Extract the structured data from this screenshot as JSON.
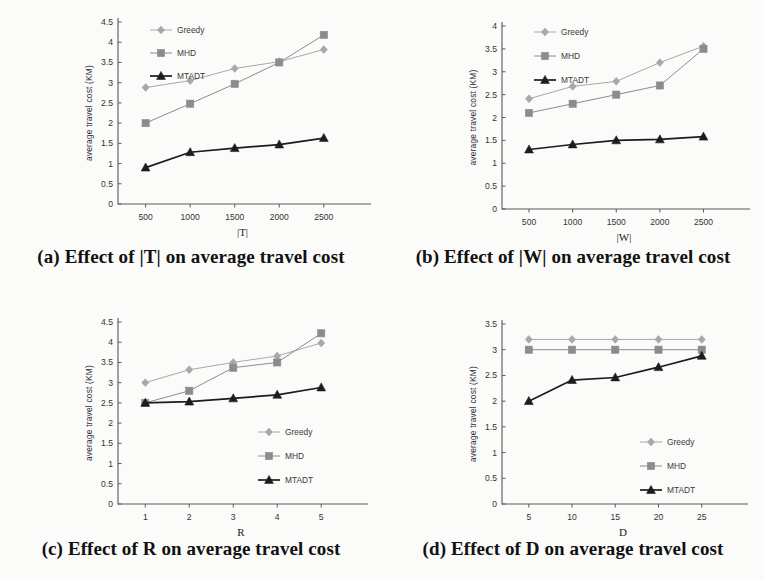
{
  "figure": {
    "series_names": [
      "Greedy",
      "MHD",
      "MTADT"
    ],
    "colors": {
      "greedy": "#a8a8a8",
      "mhd": "#8c8c8c",
      "mtadt": "#1c1c1c",
      "axis": "#5a5a5a",
      "text": "#1a1a1a"
    },
    "y_axis_label": "average travel cost (KM)"
  },
  "panels": [
    {
      "id": "a",
      "caption": "(a) Effect of |T| on average travel cost",
      "chart_data": {
        "type": "line",
        "title": "",
        "xlabel": "|T|",
        "ylabel": "average travel cost (KM)",
        "x": [
          500,
          1000,
          1500,
          2000,
          2500
        ],
        "xticklabels": [
          "500",
          "1000",
          "1500",
          "2000",
          "2500"
        ],
        "ylim": [
          0,
          4.5
        ],
        "yticks": [
          0,
          0.5,
          1,
          1.5,
          2,
          2.5,
          3,
          3.5,
          4,
          4.5
        ],
        "yticklabels": [
          "0",
          "0.5",
          "1",
          "1.5",
          "2",
          "2.5",
          "3",
          "3.5",
          "4",
          "4.5"
        ],
        "grid": false,
        "legend_position": "top-left-inside",
        "series": [
          {
            "name": "Greedy",
            "marker": "diamond",
            "values": [
              2.88,
              3.05,
              3.35,
              3.52,
              3.82
            ]
          },
          {
            "name": "MHD",
            "marker": "square",
            "values": [
              2.0,
              2.48,
              2.97,
              3.5,
              4.18
            ]
          },
          {
            "name": "MTADT",
            "marker": "triangle",
            "values": [
              0.9,
              1.28,
              1.38,
              1.47,
              1.63
            ]
          }
        ]
      }
    },
    {
      "id": "b",
      "caption": "(b) Effect of |W| on average travel cost",
      "chart_data": {
        "type": "line",
        "title": "",
        "xlabel": "|W|",
        "ylabel": "average travel cost (KM)",
        "x": [
          500,
          1000,
          1500,
          2000,
          2500
        ],
        "xticklabels": [
          "500",
          "1000",
          "1500",
          "2000",
          "2500"
        ],
        "ylim": [
          0,
          4
        ],
        "yticks": [
          0,
          0.5,
          1,
          1.5,
          2,
          2.5,
          3,
          3.5,
          4
        ],
        "yticklabels": [
          "0",
          "0.5",
          "1",
          "1.5",
          "2",
          "2.5",
          "3",
          "3.5",
          "4"
        ],
        "grid": false,
        "legend_position": "top-left-inside",
        "series": [
          {
            "name": "Greedy",
            "marker": "diamond",
            "values": [
              2.41,
              2.68,
              2.79,
              3.2,
              3.56
            ]
          },
          {
            "name": "MHD",
            "marker": "square",
            "values": [
              2.1,
              2.3,
              2.5,
              2.7,
              3.5
            ]
          },
          {
            "name": "MTADT",
            "marker": "triangle",
            "values": [
              1.3,
              1.41,
              1.5,
              1.52,
              1.58
            ]
          }
        ]
      }
    },
    {
      "id": "c",
      "caption": "(c) Effect of R on average travel cost",
      "chart_data": {
        "type": "line",
        "title": "",
        "xlabel": "R",
        "ylabel": "average travel cost (KM)",
        "x": [
          1,
          2,
          3,
          4,
          5
        ],
        "xticklabels": [
          "1",
          "2",
          "3",
          "4",
          "5"
        ],
        "ylim": [
          0,
          4.5
        ],
        "yticks": [
          0,
          0.5,
          1,
          1.5,
          2,
          2.5,
          3,
          3.5,
          4,
          4.5
        ],
        "yticklabels": [
          "0",
          "0.5",
          "1",
          "1.5",
          "2",
          "2.5",
          "3",
          "3.5",
          "4",
          "4.5"
        ],
        "grid": false,
        "legend_position": "bottom-right-inside",
        "series": [
          {
            "name": "Greedy",
            "marker": "diamond",
            "values": [
              3.0,
              3.32,
              3.5,
              3.66,
              3.98
            ]
          },
          {
            "name": "MHD",
            "marker": "square",
            "values": [
              2.5,
              2.8,
              3.37,
              3.5,
              4.22
            ]
          },
          {
            "name": "MTADT",
            "marker": "triangle",
            "values": [
              2.5,
              2.53,
              2.61,
              2.7,
              2.88
            ]
          }
        ]
      }
    },
    {
      "id": "d",
      "caption": "(d) Effect of D on average travel cost",
      "chart_data": {
        "type": "line",
        "title": "",
        "xlabel": "D",
        "ylabel": "average travel cost (KM)",
        "x": [
          5,
          10,
          15,
          20,
          25
        ],
        "xticklabels": [
          "5",
          "10",
          "15",
          "20",
          "25"
        ],
        "ylim": [
          0,
          3.5
        ],
        "yticks": [
          0,
          0.5,
          1,
          1.5,
          2,
          2.5,
          3,
          3.5
        ],
        "yticklabels": [
          "0",
          "0.5",
          "1",
          "1.5",
          "2",
          "2.5",
          "3",
          "3.5"
        ],
        "grid": false,
        "legend_position": "bottom-right-inside",
        "series": [
          {
            "name": "Greedy",
            "marker": "diamond",
            "values": [
              3.2,
              3.2,
              3.2,
              3.2,
              3.2
            ]
          },
          {
            "name": "MHD",
            "marker": "square",
            "values": [
              3.0,
              3.0,
              3.0,
              3.0,
              3.0
            ]
          },
          {
            "name": "MTADT",
            "marker": "triangle",
            "values": [
              2.0,
              2.41,
              2.46,
              2.66,
              2.88
            ]
          }
        ]
      }
    }
  ]
}
